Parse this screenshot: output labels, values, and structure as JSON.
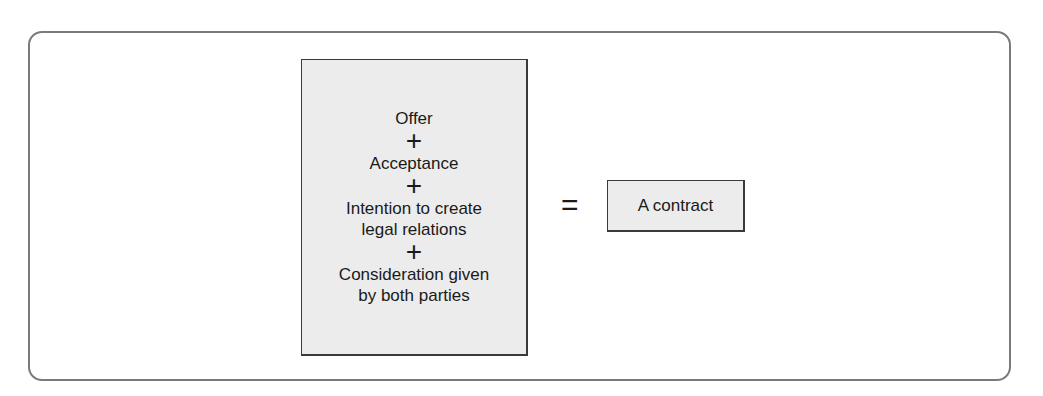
{
  "diagram": {
    "terms": [
      {
        "label": "Offer"
      },
      {
        "label": "Acceptance"
      },
      {
        "label": "Intention to create legal relations",
        "lines": [
          "Intention to create",
          "legal relations"
        ]
      },
      {
        "label": "Consideration given by both parties",
        "lines": [
          "Consideration given",
          "by both parties"
        ]
      }
    ],
    "operator_plus": "+",
    "operator_equals": "=",
    "result": "A contract",
    "colors": {
      "box_fill": "#ececec",
      "box_border": "#3a3a3a",
      "frame_border": "#7a7a7a"
    }
  }
}
